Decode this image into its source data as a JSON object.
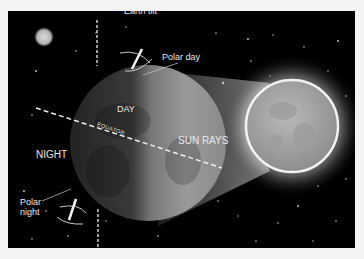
{
  "diagram": {
    "labels": {
      "earth_tilt": "Earth tilt",
      "polar_day": "Polar day",
      "day": "DAY",
      "night": "NIGHT",
      "equator": "EQUATOR",
      "sun_rays": "SUN RAYS",
      "polar_night_line1": "Polar",
      "polar_night_line2": "night"
    },
    "colors": {
      "background": "#000000",
      "frame": "#f4f4f4",
      "text": "#e8e8e8",
      "earth_day": "#9a9a9a",
      "earth_night": "#2e2e2e",
      "sun_core": "#a8a8a8",
      "sun_glow": "#ffffff"
    },
    "objects": [
      {
        "name": "moon",
        "cx": 36,
        "cy": 26,
        "r": 9
      },
      {
        "name": "earth",
        "cx": 140,
        "cy": 132,
        "r": 78
      },
      {
        "name": "sun",
        "cx": 284,
        "cy": 115,
        "r": 46
      }
    ]
  }
}
